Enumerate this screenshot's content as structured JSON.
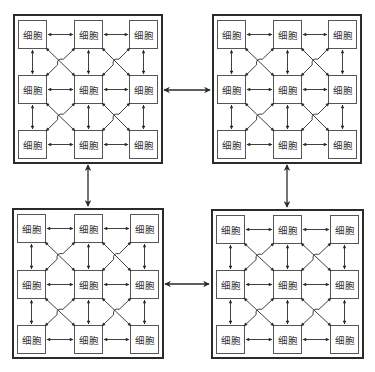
{
  "diagram": {
    "cell_label": "细胞",
    "colors": {
      "line": "#2a2a2a",
      "cell_border": "#555555",
      "text": "#333333",
      "background": "#ffffff"
    },
    "quadrants": [
      {
        "id": "top-left",
        "rows": 3,
        "cols": 3,
        "cells": [
          "细胞",
          "细胞",
          "细胞",
          "细胞",
          "细胞",
          "细胞",
          "细胞",
          "细胞",
          "细胞"
        ]
      },
      {
        "id": "top-right",
        "rows": 3,
        "cols": 3,
        "cells": [
          "细胞",
          "细胞",
          "细胞",
          "细胞",
          "细胞",
          "细胞",
          "细胞",
          "细胞",
          "细胞"
        ]
      },
      {
        "id": "bottom-left",
        "rows": 3,
        "cols": 3,
        "cells": [
          "细胞",
          "细胞",
          "细胞",
          "细胞",
          "细胞",
          "细胞",
          "细胞",
          "细胞",
          "细胞"
        ]
      },
      {
        "id": "bottom-right",
        "rows": 3,
        "cols": 3,
        "cells": [
          "细胞",
          "细胞",
          "细胞",
          "细胞",
          "细胞",
          "细胞",
          "细胞",
          "细胞",
          "细胞"
        ]
      }
    ],
    "inter_quadrant_links": [
      {
        "from": "top-left",
        "to": "top-right",
        "direction": "bidirectional"
      },
      {
        "from": "top-right",
        "to": "bottom-right",
        "direction": "bidirectional"
      },
      {
        "from": "bottom-right",
        "to": "bottom-left",
        "direction": "bidirectional"
      },
      {
        "from": "bottom-left",
        "to": "top-left",
        "direction": "bidirectional"
      }
    ],
    "intra_quadrant_links": "each cell connected bidirectionally to horizontal, vertical, and diagonal neighbors"
  }
}
